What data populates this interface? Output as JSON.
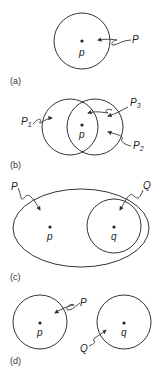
{
  "figure": {
    "panels": [
      {
        "id": "a",
        "caption": "(a)",
        "point_label": "p",
        "region_labels": [
          "P"
        ]
      },
      {
        "id": "b",
        "caption": "(b)",
        "point_label": "p",
        "region_labels": [
          "P1",
          "P3",
          "P2"
        ],
        "region_label_parts": [
          {
            "base": "P",
            "sub": "1"
          },
          {
            "base": "P",
            "sub": "3"
          },
          {
            "base": "P",
            "sub": "2"
          }
        ]
      },
      {
        "id": "c",
        "caption": "(c)",
        "point_labels": [
          "p",
          "q"
        ],
        "region_labels": [
          "P",
          "Q"
        ]
      },
      {
        "id": "d",
        "caption": "(d)",
        "point_labels": [
          "p",
          "q"
        ],
        "region_labels": [
          "P",
          "Q"
        ]
      }
    ]
  }
}
